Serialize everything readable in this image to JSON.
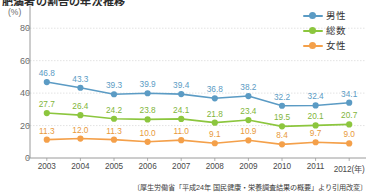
{
  "title": "肥満者の割合の年次推移",
  "axis": {
    "y_unit": "(%)",
    "y_ticks": [
      "0",
      "20",
      "40",
      "60",
      "80"
    ],
    "x_ticks": [
      "2003",
      "2004",
      "2005",
      "2006",
      "2007",
      "2008",
      "2009",
      "2010",
      "2011",
      "2012(年)"
    ]
  },
  "legend": {
    "items": [
      {
        "label": "男性",
        "color": "#5b9bc4",
        "key": "male"
      },
      {
        "label": "総数",
        "color": "#8cc63e",
        "key": "total"
      },
      {
        "label": "女性",
        "color": "#f4a04a",
        "key": "female"
      }
    ]
  },
  "source": "〔厚生労働省「平成24年 国民健康・栄養調査結果の概要」より引用改変〕",
  "colors": {
    "male": "#5b9bc4",
    "total": "#8cc63e",
    "female": "#f4a04a",
    "grid": "#dcdcdc",
    "axis": "#9a9a9a",
    "background": "#ffffff"
  },
  "chart_data": {
    "type": "line",
    "title": "肥満者の割合の年次推移",
    "xlabel": "(年)",
    "ylabel": "(%)",
    "ylim": [
      0,
      90
    ],
    "yticks": [
      0,
      20,
      40,
      60,
      80
    ],
    "grid": true,
    "legend_position": "top-right",
    "categories": [
      "2003",
      "2004",
      "2005",
      "2006",
      "2007",
      "2008",
      "2009",
      "2010",
      "2011",
      "2012"
    ],
    "series": [
      {
        "name": "男性",
        "color": "#5b9bc4",
        "values": [
          46.8,
          43.3,
          39.3,
          39.9,
          39.4,
          36.8,
          38.2,
          32.2,
          32.4,
          34.1
        ]
      },
      {
        "name": "総数",
        "color": "#8cc63e",
        "values": [
          27.7,
          26.4,
          24.2,
          23.8,
          24.1,
          21.8,
          23.4,
          19.5,
          20.1,
          20.7
        ]
      },
      {
        "name": "女性",
        "color": "#f4a04a",
        "values": [
          11.3,
          12.0,
          11.3,
          10.0,
          11.0,
          9.1,
          10.9,
          8.4,
          9.7,
          9.0
        ]
      }
    ],
    "data_labels": {
      "男性": [
        "46.8",
        "43.3",
        "39.3",
        "39.9",
        "39.4",
        "36.8",
        "38.2",
        "32.2",
        "32.4",
        "34.1"
      ],
      "総数": [
        "27.7",
        "26.4",
        "24.2",
        "23.8",
        "24.1",
        "21.8",
        "23.4",
        "19.5",
        "20.1",
        "20.7"
      ],
      "女性": [
        "11.3",
        "12.0",
        "11.3",
        "10.0",
        "11.0",
        "9.1",
        "10.9",
        "8.4",
        "9.7",
        "9.0"
      ]
    }
  }
}
